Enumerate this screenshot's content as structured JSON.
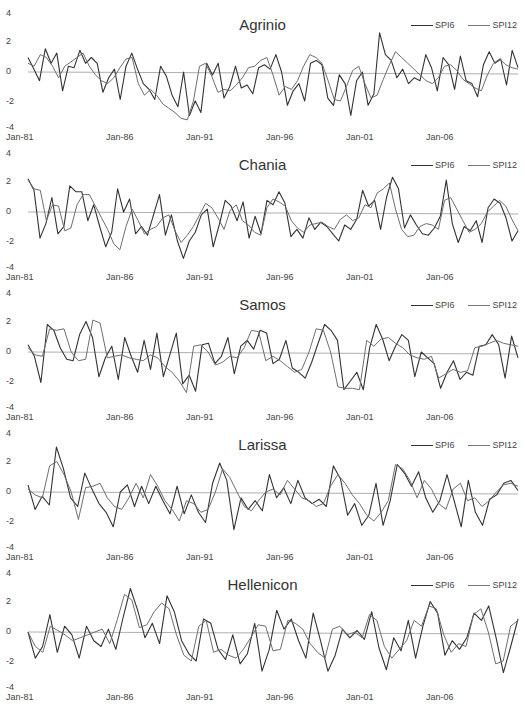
{
  "chart_data": [
    {
      "type": "line",
      "title": "Agrinio",
      "xlabel": "",
      "ylabel": "",
      "x_ticks": [
        "Jan-81",
        "Jan-86",
        "Jan-91",
        "Jan-96",
        "Jan-01",
        "Jan-06"
      ],
      "y_ticks": [
        "4",
        "2",
        "0",
        "-2",
        "-4"
      ],
      "ylim": [
        -4,
        4
      ],
      "grid": false,
      "legend_position": "top-right",
      "series": [
        {
          "name": "SPI6",
          "values": [
            1.0,
            0.2,
            -0.6,
            1.6,
            0.6,
            1.3,
            -1.3,
            0.4,
            0.3,
            1.5,
            0.6,
            1.0,
            0.6,
            -1.4,
            -0.4,
            0.2,
            -1.9,
            0.4,
            1.3,
            0.2,
            -0.8,
            -1.2,
            -1.9,
            0.4,
            -0.3,
            -1.6,
            -2.4,
            0.0,
            -3.0,
            -2.0,
            -2.8,
            0.6,
            -0.2,
            0.6,
            -1.8,
            -1.0,
            0.4,
            -1.1,
            -0.9,
            -1.5,
            0.3,
            0.5,
            0.2,
            1.2,
            0.0,
            -2.3,
            -1.3,
            -0.8,
            -2.0,
            0.6,
            0.8,
            0.5,
            -1.8,
            -2.3,
            -0.2,
            -0.8,
            -3.0,
            -0.6,
            0.0,
            -2.3,
            -1.5,
            2.7,
            1.2,
            0.8,
            -0.4,
            0.2,
            -0.8,
            -0.4,
            -0.6,
            1.2,
            0.3,
            -1.3,
            1.0,
            0.5,
            -1.2,
            1.1,
            -0.6,
            -0.8,
            -1.7,
            0.5,
            1.4,
            0.6,
            0.9,
            -0.9,
            1.5,
            0.3
          ]
        },
        {
          "name": "SPI12",
          "values": [
            0.6,
            0.4,
            1.2,
            1.0,
            0.4,
            -0.4,
            0.4,
            0.7,
            1.0,
            1.3,
            0.4,
            -0.2,
            -0.6,
            -0.8,
            -0.4,
            0.3,
            0.9,
            1.0,
            -0.8,
            -1.6,
            -1.2,
            -1.6,
            -2.2,
            -2.5,
            -2.8,
            -3.2,
            -3.3,
            -2.0,
            0.4,
            0.6,
            -0.3,
            -1.4,
            -1.2,
            -1.3,
            -0.9,
            -0.4,
            0.3,
            0.4,
            0.8,
            1.0,
            -0.2,
            -1.6,
            -1.0,
            -1.2,
            -0.6,
            0.4,
            1.2,
            1.0,
            0.6,
            -0.6,
            -1.9,
            -2.0,
            -1.0,
            0.1,
            0.4,
            -0.8,
            -1.8,
            -1.6,
            -0.5,
            0.5,
            1.4,
            1.0,
            0.6,
            0.2,
            -0.2,
            -0.6,
            -0.8,
            -0.4,
            0.4,
            0.5,
            0.1,
            -0.5,
            -0.8,
            -1.1,
            -1.3,
            -0.2,
            0.6,
            0.9,
            0.5,
            0.3,
            0.2
          ]
        }
      ]
    },
    {
      "type": "line",
      "title": "Chania",
      "xlabel": "",
      "ylabel": "",
      "x_ticks": [
        "Jan-81",
        "Jan-86",
        "Jan-91",
        "Jan-96",
        "Jan-01",
        "Jan-06"
      ],
      "y_ticks": [
        "4",
        "2",
        "0",
        "-2",
        "-4"
      ],
      "ylim": [
        -4,
        4
      ],
      "grid": false,
      "legend_position": "top-right",
      "series": [
        {
          "name": "SPI6",
          "values": [
            2.3,
            1.5,
            -1.8,
            -0.8,
            1.0,
            -1.5,
            -1.0,
            1.8,
            1.4,
            1.4,
            -0.6,
            0.5,
            -1.0,
            -2.4,
            -1.4,
            1.6,
            0.0,
            0.9,
            -1.5,
            -1.0,
            -1.6,
            -0.2,
            1.2,
            -1.6,
            -0.2,
            -2.0,
            -3.2,
            -2.0,
            -1.4,
            -0.2,
            0.2,
            -2.4,
            -0.9,
            0.8,
            0.4,
            -0.6,
            0.7,
            -1.8,
            -0.3,
            -1.5,
            0.8,
            0.5,
            1.4,
            0.6,
            -1.7,
            -1.2,
            -1.8,
            -0.4,
            -1.2,
            -0.7,
            -1.0,
            -1.5,
            -2.0,
            -0.9,
            -1.2,
            -0.5,
            1.5,
            0.4,
            0.8,
            -1.2,
            1.0,
            2.4,
            1.6,
            -1.1,
            -0.2,
            -0.9,
            -1.5,
            -1.6,
            -1.1,
            -0.3,
            2.2,
            -0.8,
            -2.1,
            -1.0,
            -1.3,
            -0.6,
            -2.1,
            0.3,
            0.9,
            0.6,
            -0.4,
            -2.0,
            -1.3
          ]
        },
        {
          "name": "SPI12",
          "values": [
            2.2,
            1.6,
            1.5,
            -0.6,
            0.5,
            0.4,
            -1.3,
            -1.1,
            0.5,
            1.2,
            1.2,
            0.4,
            -0.4,
            -1.2,
            -2.2,
            -2.6,
            -1.0,
            0.2,
            -0.6,
            -1.5,
            -1.2,
            -1.0,
            -0.4,
            -0.2,
            -1.3,
            -2.1,
            -1.6,
            -1.0,
            -0.2,
            0.6,
            0.3,
            -0.4,
            -1.2,
            0.1,
            0.5,
            -0.6,
            -0.9,
            -1.4,
            -1.6,
            0.3,
            0.9,
            0.7,
            0.4,
            -0.6,
            -1.1,
            -1.4,
            -0.9,
            -0.8,
            -0.7,
            -1.0,
            -1.2,
            -0.5,
            -0.2,
            -0.6,
            -0.4,
            0.5,
            0.3,
            1.3,
            1.6,
            2.0,
            0.2,
            -1.2,
            -1.7,
            -1.6,
            -1.0,
            -0.8,
            -0.9,
            -1.2,
            0.8,
            1.0,
            0.2,
            -0.6,
            -1.4,
            -1.2,
            -0.8,
            0.0,
            0.4,
            0.8,
            0.4,
            -0.5,
            -1.3
          ]
        }
      ]
    },
    {
      "type": "line",
      "title": "Samos",
      "xlabel": "",
      "ylabel": "",
      "x_ticks": [
        "Jan-81",
        "Jan-86",
        "Jan-91",
        "Jan-96",
        "Jan-01",
        "Jan-06"
      ],
      "y_ticks": [
        "4",
        "2",
        "0",
        "-2",
        "-4"
      ],
      "ylim": [
        -4,
        4
      ],
      "grid": false,
      "legend_position": "top-right",
      "series": [
        {
          "name": "SPI6",
          "values": [
            0.5,
            -0.3,
            -2.1,
            1.9,
            1.5,
            0.3,
            -0.5,
            -0.6,
            1.2,
            2.1,
            1.0,
            -1.7,
            -0.4,
            0.4,
            -1.9,
            1.0,
            -0.3,
            -1.4,
            0.8,
            -1.2,
            1.3,
            -1.7,
            -0.2,
            1.3,
            -2.2,
            -1.6,
            -2.7,
            0.5,
            0.6,
            -0.8,
            -0.3,
            1.0,
            -1.5,
            0.4,
            0.8,
            0.2,
            1.5,
            1.3,
            -0.8,
            -0.5,
            0.8,
            -1.1,
            -1.4,
            -1.8,
            -0.7,
            0.6,
            1.9,
            1.5,
            0.8,
            -2.6,
            -2.0,
            -1.4,
            -2.6,
            0.3,
            1.9,
            0.9,
            -0.6,
            0.4,
            1.2,
            0.8,
            -1.7,
            0.0,
            -0.4,
            -0.8,
            -2.5,
            -1.4,
            -0.6,
            -1.9,
            -1.4,
            -1.6,
            0.4,
            0.5,
            1.2,
            0.5,
            -1.8,
            1.1,
            -0.4
          ]
        },
        {
          "name": "SPI12",
          "values": [
            0.3,
            -0.2,
            -0.3,
            1.6,
            1.5,
            1.6,
            0.0,
            -0.6,
            -0.5,
            2.2,
            2.0,
            -0.4,
            -0.3,
            -0.2,
            -0.4,
            -0.5,
            -0.6,
            -0.2,
            -0.4,
            -1.0,
            -1.4,
            -2.0,
            -2.8,
            0.4,
            0.5,
            0.0,
            -0.9,
            -0.7,
            -0.3,
            -0.4,
            0.3,
            1.5,
            1.4,
            -0.6,
            -0.3,
            -0.6,
            -1.0,
            -1.4,
            -1.2,
            0.0,
            1.6,
            1.5,
            0.0,
            -2.4,
            -2.5,
            -2.5,
            -2.6,
            0.8,
            0.4,
            0.9,
            1.0,
            0.6,
            0.3,
            -0.2,
            -0.4,
            -0.5,
            -0.3,
            -1.8,
            -1.5,
            -1.2,
            -1.4,
            -1.3,
            0.3,
            0.4,
            0.6,
            0.8,
            0.6,
            0.5,
            0.4
          ]
        }
      ]
    },
    {
      "type": "line",
      "title": "Larissa",
      "xlabel": "",
      "ylabel": "",
      "x_ticks": [
        "Jan-81",
        "Jan-86",
        "Jan-91",
        "Jan-96",
        "Jan-01",
        "Jan-06"
      ],
      "y_ticks": [
        "4",
        "2",
        "0",
        "-2",
        "-4"
      ],
      "ylim": [
        -4,
        4
      ],
      "grid": false,
      "legend_position": "top-right",
      "series": [
        {
          "name": "SPI6",
          "values": [
            0.5,
            -1.2,
            -0.3,
            -0.9,
            3.1,
            1.6,
            -0.4,
            -1.0,
            1.3,
            0.2,
            -0.8,
            -1.4,
            -2.4,
            0.0,
            0.5,
            -1.0,
            0.4,
            -0.8,
            0.4,
            -0.6,
            -1.5,
            0.4,
            -1.5,
            -0.2,
            -1.4,
            -2.1,
            0.6,
            2.0,
            0.8,
            -2.6,
            -0.4,
            -1.2,
            -0.6,
            -1.3,
            1.2,
            -0.4,
            0.3,
            -0.8,
            0.8,
            -0.4,
            -0.8,
            -0.5,
            -1.0,
            1.8,
            0.9,
            -1.6,
            -0.8,
            -2.3,
            -1.6,
            0.6,
            -2.3,
            -0.6,
            1.9,
            1.3,
            0.4,
            1.4,
            -0.4,
            -1.4,
            -0.6,
            1.2,
            -0.6,
            -2.4,
            0.8,
            -1.4,
            -2.3,
            -0.5,
            -0.2,
            0.6,
            0.8,
            0.1
          ]
        },
        {
          "name": "SPI12",
          "values": [
            0.2,
            -0.2,
            -0.4,
            1.8,
            2.1,
            1.2,
            0.0,
            -1.9,
            0.3,
            0.4,
            0.6,
            -0.4,
            -1.0,
            -1.2,
            -0.4,
            0.6,
            -0.4,
            1.2,
            0.4,
            -0.6,
            -1.2,
            -2.0,
            -0.6,
            -0.8,
            -1.4,
            -1.2,
            0.0,
            1.6,
            1.0,
            0.0,
            -1.0,
            -1.3,
            -0.6,
            0.0,
            0.2,
            -0.2,
            0.8,
            0.2,
            -0.4,
            -0.6,
            -1.0,
            -0.8,
            0.4,
            1.2,
            0.6,
            -0.2,
            -0.8,
            -1.6,
            -2.0,
            -1.4,
            -0.6,
            1.9,
            1.6,
            0.8,
            -0.4,
            0.8,
            0.2,
            -0.8,
            -1.2,
            0.2,
            0.6,
            -0.6,
            -0.4,
            -1.0,
            -0.6,
            0.0,
            0.5,
            0.6,
            0.4
          ]
        }
      ]
    },
    {
      "type": "line",
      "title": "Hellenicon",
      "xlabel": "",
      "ylabel": "",
      "x_ticks": [
        "Jan-81",
        "Jan-86",
        "Jan-91",
        "Jan-96",
        "Jan-01",
        "Jan-06"
      ],
      "y_ticks": [
        "4",
        "2",
        "0",
        "-2",
        "-4"
      ],
      "ylim": [
        -4,
        4
      ],
      "grid": false,
      "legend_position": "top-right",
      "series": [
        {
          "name": "SPI6",
          "values": [
            0.0,
            -1.8,
            -1.0,
            1.2,
            -1.4,
            0.4,
            -0.2,
            -1.8,
            0.4,
            -0.6,
            -1.0,
            0.2,
            -1.2,
            1.0,
            3.0,
            1.5,
            -0.4,
            0.6,
            -0.8,
            2.5,
            1.4,
            -0.6,
            -1.5,
            -2.0,
            0.9,
            0.6,
            -1.2,
            -1.9,
            -0.2,
            -2.2,
            -1.5,
            0.6,
            -2.7,
            -1.2,
            1.5,
            0.2,
            0.9,
            -0.6,
            -1.8,
            1.3,
            -0.6,
            -2.7,
            -1.6,
            0.2,
            -0.4,
            0.1,
            -0.5,
            1.4,
            -1.1,
            -2.6,
            -0.4,
            -1.3,
            0.8,
            -1.8,
            0.4,
            2.1,
            1.3,
            -1.6,
            -0.6,
            -1.2,
            -0.4,
            1.3,
            0.8,
            1.8,
            -0.4,
            -2.8,
            -1.0,
            0.9
          ]
        },
        {
          "name": "SPI12",
          "values": [
            0.0,
            -1.0,
            -1.4,
            0.4,
            0.1,
            -0.2,
            -0.6,
            -0.4,
            -0.2,
            0.0,
            0.2,
            -0.8,
            0.8,
            2.6,
            2.2,
            0.3,
            0.5,
            1.4,
            2.0,
            1.6,
            -0.2,
            -1.6,
            -2.0,
            0.4,
            0.8,
            -1.4,
            -1.2,
            -1.6,
            -1.8,
            -1.2,
            -0.4,
            0.5,
            0.4,
            -1.3,
            -1.2,
            0.8,
            0.6,
            0.2,
            -0.8,
            -1.4,
            -1.8,
            0.2,
            0.4,
            -0.2,
            0.0,
            -0.4,
            1.2,
            0.8,
            -1.0,
            -1.8,
            -1.2,
            -0.6,
            0.8,
            0.4,
            1.8,
            1.6,
            -0.2,
            -1.4,
            -0.8,
            -1.0,
            1.2,
            1.6,
            0.0,
            -2.2,
            -2.0,
            0.4,
            0.8
          ]
        }
      ]
    }
  ],
  "panels": [
    {
      "title": "Agrinio",
      "legend": [
        "SPI6",
        "SPI12"
      ],
      "y_ticks": [
        "4",
        "2",
        "0",
        "-2",
        "-4"
      ],
      "x_ticks": [
        "Jan-81",
        "Jan-86",
        "Jan-91",
        "Jan-96",
        "Jan-01",
        "Jan-06"
      ]
    },
    {
      "title": "Chania",
      "legend": [
        "SPI6",
        "SPI12"
      ],
      "y_ticks": [
        "4",
        "2",
        "0",
        "-2",
        "-4"
      ],
      "x_ticks": [
        "Jan-81",
        "Jan-86",
        "Jan-91",
        "Jan-96",
        "Jan-01",
        "Jan-06"
      ]
    },
    {
      "title": "Samos",
      "legend": [
        "SPI6",
        "SPI12"
      ],
      "y_ticks": [
        "4",
        "2",
        "0",
        "-2",
        "-4"
      ],
      "x_ticks": [
        "Jan-81",
        "Jan-86",
        "Jan-91",
        "Jan-96",
        "Jan-01",
        "Jan-06"
      ]
    },
    {
      "title": "Larissa",
      "legend": [
        "SPI6",
        "SPI12"
      ],
      "y_ticks": [
        "4",
        "2",
        "0",
        "-2",
        "-4"
      ],
      "x_ticks": [
        "Jan-81",
        "Jan-86",
        "Jan-91",
        "Jan-96",
        "Jan-01",
        "Jan-06"
      ]
    },
    {
      "title": "Hellenicon",
      "legend": [
        "SPI6",
        "SPI12"
      ],
      "y_ticks": [
        "4",
        "2",
        "0",
        "-2",
        "-4"
      ],
      "x_ticks": [
        "Jan-81",
        "Jan-86",
        "Jan-91",
        "Jan-96",
        "Jan-01",
        "Jan-06"
      ]
    }
  ],
  "colors": {
    "spi6": "#333333",
    "spi12": "#6e6e6e",
    "zero_line": "#999999",
    "text": "#444444"
  }
}
